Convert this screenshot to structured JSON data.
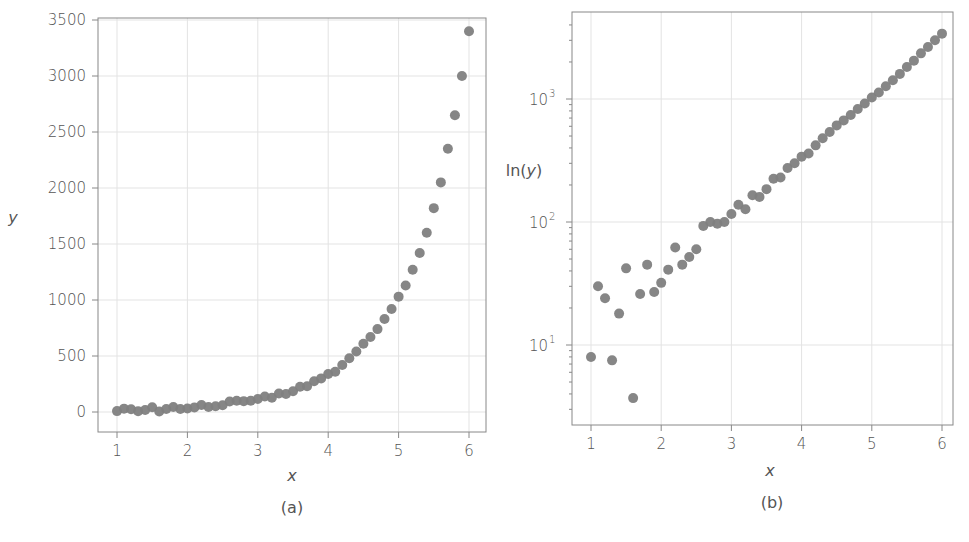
{
  "chart_data": [
    {
      "id": "a",
      "type": "scatter",
      "panel_label": "(a)",
      "title": "",
      "xlabel": "x",
      "ylabel": "y",
      "yscale": "linear",
      "xlim": [
        0.75,
        6.25
      ],
      "ylim": [
        -180,
        3570
      ],
      "xticks": [
        1,
        2,
        3,
        4,
        5,
        6
      ],
      "xtick_labels": [
        "1",
        "2",
        "3",
        "4",
        "5",
        "6"
      ],
      "yticks": [
        0,
        500,
        1000,
        1500,
        2000,
        2500,
        3000,
        3500
      ],
      "ytick_labels": [
        "0",
        "500",
        "1000",
        "1500",
        "2000",
        "2500",
        "3000",
        "3500"
      ],
      "grid": true,
      "marker_color": "#808080",
      "series_ref": "shared"
    },
    {
      "id": "b",
      "type": "scatter",
      "panel_label": "(b)",
      "title": "",
      "xlabel": "x",
      "ylabel": "ln(y)",
      "yscale": "log",
      "xlim": [
        0.75,
        6.25
      ],
      "ylim": [
        2.9,
        4500
      ],
      "xticks": [
        1,
        2,
        3,
        4,
        5,
        6
      ],
      "xtick_labels": [
        "1",
        "2",
        "3",
        "4",
        "5",
        "6"
      ],
      "yticks": [
        10,
        100,
        1000
      ],
      "ytick_labels": [
        {
          "base": "10",
          "exp": "1"
        },
        {
          "base": "10",
          "exp": "2"
        },
        {
          "base": "10",
          "exp": "3"
        }
      ],
      "grid": true,
      "marker_color": "#808080",
      "series_ref": "shared"
    }
  ],
  "series": {
    "name": "data",
    "x": [
      1.0,
      1.1,
      1.2,
      1.3,
      1.4,
      1.5,
      1.6,
      1.7,
      1.8,
      1.9,
      2.0,
      2.1,
      2.2,
      2.3,
      2.4,
      2.5,
      2.6,
      2.7,
      2.8,
      2.9,
      3.0,
      3.1,
      3.2,
      3.3,
      3.4,
      3.5,
      3.6,
      3.7,
      3.8,
      3.9,
      4.0,
      4.1,
      4.2,
      4.3,
      4.4,
      4.5,
      4.6,
      4.7,
      4.8,
      4.9,
      5.0,
      5.1,
      5.2,
      5.3,
      5.4,
      5.5,
      5.6,
      5.7,
      5.8,
      5.9,
      6.0
    ],
    "y": [
      8,
      30,
      24,
      7.5,
      18,
      42,
      3.7,
      26,
      45,
      27,
      32,
      41,
      62,
      45,
      52,
      60,
      93,
      100,
      97,
      100,
      116,
      138,
      127,
      165,
      160,
      185,
      225,
      230,
      275,
      300,
      340,
      360,
      420,
      480,
      540,
      610,
      670,
      740,
      830,
      920,
      1030,
      1130,
      1270,
      1420,
      1600,
      1820,
      2050,
      2350,
      2650,
      3000,
      3400
    ]
  },
  "figure": {
    "panel_a_label": "(a)",
    "panel_b_label": "(b)",
    "axis_a_xlabel": "x",
    "axis_a_ylabel": "y",
    "axis_b_xlabel": "x",
    "axis_b_ylabel_prefix": "ln(",
    "axis_b_ylabel_var": "y",
    "axis_b_ylabel_suffix": ")"
  }
}
